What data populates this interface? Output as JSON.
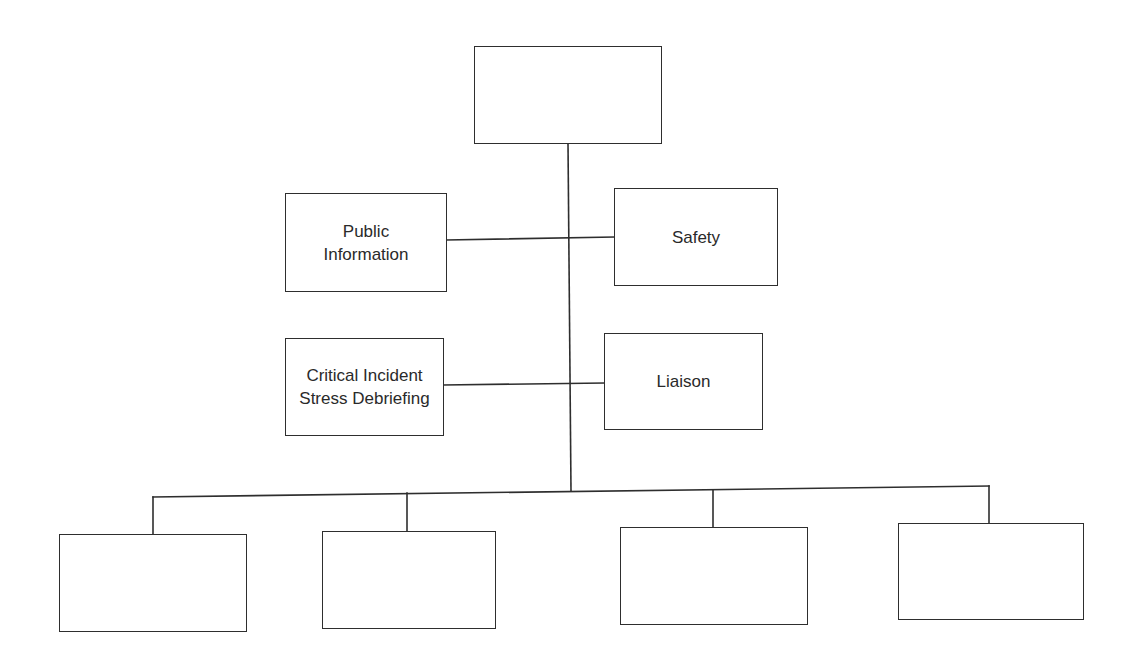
{
  "diagram": {
    "type": "organizational-chart",
    "colors": {
      "line": "#2e2e2e",
      "box_border": "#2e2e2e",
      "text": "#2a2a2a",
      "background": "#ffffff"
    },
    "top": {
      "label": ""
    },
    "staff_left": [
      {
        "label": "Public\nInformation"
      },
      {
        "label": "Critical Incident\nStress Debriefing"
      }
    ],
    "staff_right": [
      {
        "label": "Safety"
      },
      {
        "label": "Liaison"
      }
    ],
    "sections": [
      {
        "label": ""
      },
      {
        "label": ""
      },
      {
        "label": ""
      },
      {
        "label": ""
      }
    ]
  }
}
